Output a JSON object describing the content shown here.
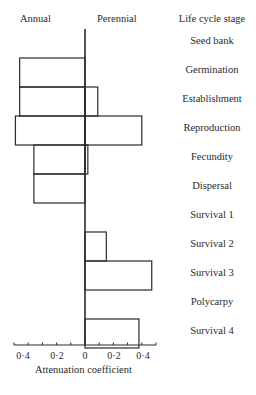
{
  "chart_data": {
    "type": "bar",
    "orientation": "horizontal",
    "title": "",
    "xlabel": "Attenuation coefficient",
    "ylabel": "Life cycle stage",
    "side_labels": {
      "left": "Annual",
      "right": "Perennial"
    },
    "categories": [
      "Seed bank",
      "Germination",
      "Establishment",
      "Reproduction",
      "Fecundity",
      "Dispersal",
      "Survival 1",
      "Survival 2",
      "Survival 3",
      "Polycarpy",
      "Survival 4"
    ],
    "series": [
      {
        "name": "Annual",
        "direction": "left",
        "values": [
          0,
          0.46,
          0.46,
          0.49,
          0.36,
          0.36,
          0,
          0,
          0,
          0,
          0
        ]
      },
      {
        "name": "Perennial",
        "direction": "right",
        "values": [
          0,
          0,
          0.09,
          0.4,
          0.02,
          0,
          0,
          0.15,
          0.47,
          0,
          0.38
        ]
      }
    ],
    "xticks": [
      "0·4",
      "0·2",
      "0",
      "0·2",
      "0·4"
    ],
    "xlim": [
      -0.5,
      0.5
    ],
    "grid": false,
    "legend": "none"
  },
  "labels": {
    "annual": "Annual",
    "perennial": "Perennial",
    "stage_header": "Life cycle stage",
    "xlabel": "Attenuation coefficient",
    "stages": [
      "Seed bank",
      "Germination",
      "Establishment",
      "Reproduction",
      "Fecundity",
      "Dispersal",
      "Survival 1",
      "Survival 2",
      "Survival 3",
      "Polycarpy",
      "Survival 4"
    ],
    "ticks": [
      "0·4",
      "0·2",
      "0",
      "0·2",
      "0·4"
    ]
  }
}
